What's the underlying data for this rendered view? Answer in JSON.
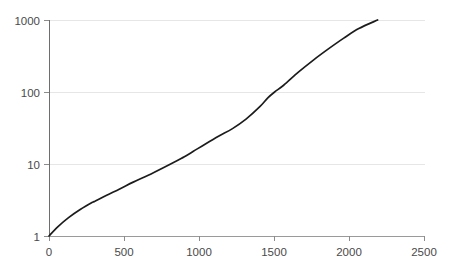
{
  "chart_data": {
    "type": "line",
    "title": "",
    "subtitle": "",
    "xlabel": "",
    "ylabel": "",
    "yscale": "log",
    "xscale": "linear",
    "xlim": [
      0,
      2500
    ],
    "ylim": [
      1,
      1000
    ],
    "grid": "horizontal",
    "legend": "none",
    "x_ticks": [
      0,
      500,
      1000,
      1500,
      2000,
      2500
    ],
    "x_tick_labels": [
      "0",
      "500",
      "1000",
      "1500",
      "2000",
      "2500"
    ],
    "y_ticks": [
      1,
      10,
      100,
      1000
    ],
    "y_tick_labels": [
      "1",
      "10",
      "100",
      "1000"
    ],
    "series": [
      {
        "name": "curve",
        "color": "#1c1c1c",
        "x": [
          0,
          60,
          130,
          210,
          290,
          300,
          380,
          470,
          560,
          660,
          760,
          860,
          900,
          960,
          1040,
          1130,
          1220,
          1310,
          1400,
          1455,
          1500,
          1560,
          1660,
          1760,
          1860,
          1960,
          2060,
          2185
        ],
        "y": [
          1,
          1.35,
          1.8,
          2.35,
          2.95,
          3.0,
          3.65,
          4.5,
          5.6,
          7.0,
          8.9,
          11.4,
          12.6,
          15.0,
          19.0,
          24.5,
          31.0,
          42.0,
          62.0,
          83.0,
          100.0,
          124.0,
          190.0,
          280.0,
          400.0,
          560.0,
          760.0,
          1000.0
        ]
      }
    ],
    "annotations": []
  },
  "colors": {
    "background": "#ffffff",
    "gridline": "#e6e6e6",
    "axis": "#9a9a9a",
    "series": "#1c1c1c",
    "tick_text": "#4a4a4a"
  }
}
